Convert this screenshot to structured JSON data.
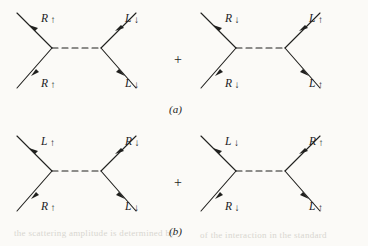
{
  "figure": {
    "background_color": "#fbfaf7",
    "ink_color": "#20201e",
    "rows": [
      {
        "caption": "(a)",
        "operator": "+",
        "diagrams": [
          {
            "name": "diagram-a-1",
            "incoming_top": {
              "particle": "R",
              "spin": "↑"
            },
            "incoming_bottom": {
              "particle": "R",
              "spin": "↑"
            },
            "outgoing_top": {
              "particle": "L",
              "spin": "↓"
            },
            "outgoing_bottom": {
              "particle": "L",
              "spin": "↓"
            },
            "propagator": "dashed"
          },
          {
            "name": "diagram-a-2",
            "incoming_top": {
              "particle": "R",
              "spin": "↓"
            },
            "incoming_bottom": {
              "particle": "R",
              "spin": "↓"
            },
            "outgoing_top": {
              "particle": "L",
              "spin": "↑"
            },
            "outgoing_bottom": {
              "particle": "L",
              "spin": "↑"
            },
            "propagator": "dashed"
          }
        ]
      },
      {
        "caption": "(b)",
        "operator": "+",
        "diagrams": [
          {
            "name": "diagram-b-1",
            "incoming_top": {
              "particle": "L",
              "spin": "↑"
            },
            "incoming_bottom": {
              "particle": "R",
              "spin": "↑"
            },
            "outgoing_top": {
              "particle": "R",
              "spin": "↓"
            },
            "outgoing_bottom": {
              "particle": "L",
              "spin": "↓"
            },
            "propagator": "dashed"
          },
          {
            "name": "diagram-b-2",
            "incoming_top": {
              "particle": "L",
              "spin": "↓"
            },
            "incoming_bottom": {
              "particle": "R",
              "spin": "↓"
            },
            "outgoing_top": {
              "particle": "R",
              "spin": "↑"
            },
            "outgoing_bottom": {
              "particle": "L",
              "spin": "↑"
            },
            "propagator": "dashed"
          }
        ]
      }
    ],
    "bleedthrough": [
      {
        "text": "the scattering amplitude is determined by",
        "x": 14,
        "y": 232
      },
      {
        "text": "of the interaction in the standard",
        "x": 196,
        "y": 234
      }
    ]
  }
}
